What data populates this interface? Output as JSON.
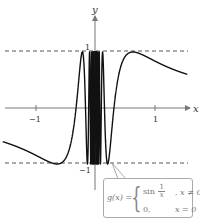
{
  "chart_data": {
    "type": "line",
    "title": "",
    "function": "g(x) = sin(1/x) for x != 0; 0 for x = 0",
    "xlabel": "x",
    "ylabel": "y",
    "x_ticks": [
      {
        "value": -1,
        "label": "−1"
      },
      {
        "value": 1,
        "label": "1"
      }
    ],
    "y_ticks": [
      {
        "value": 1,
        "label": "1"
      },
      {
        "value": -1,
        "label": "−1"
      }
    ],
    "xlim": [
      -1.6,
      1.6
    ],
    "ylim": [
      -1.4,
      1.6
    ],
    "reference_lines": [
      {
        "y": 1,
        "style": "dashed"
      },
      {
        "y": -1,
        "style": "dashed"
      }
    ],
    "grid": false,
    "annotation": {
      "text": "g(x) = { sin(1/x), x ≠ 0 ; 0, x = 0 }",
      "position": "bottom-right"
    }
  },
  "labels": {
    "x_axis": "x",
    "y_axis": "y",
    "tick_neg1_x": "−1",
    "tick_pos1_x": "1",
    "tick_pos1_y": "1",
    "tick_neg1_y": "−1"
  },
  "formula": {
    "name": "g(x) =",
    "case1_func": "sin",
    "case1_frac_num": "1",
    "case1_frac_den": "x",
    "case1_cond": ", x ≠ 0",
    "case2_val": "0,",
    "case2_cond": "x = 0"
  },
  "colors": {
    "curve": "#111111",
    "axis": "#777777",
    "dashed": "#555555",
    "box_border": "#aaaaaa",
    "text": "#777777"
  }
}
